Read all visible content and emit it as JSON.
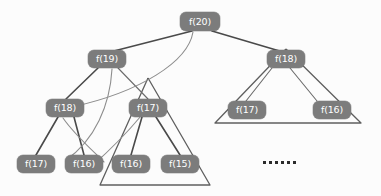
{
  "figure": {
    "background_color": "#fcfcfc",
    "node_fill_color": "#7c7c7c",
    "node_text_color": "#ffffff",
    "edge_color": "#4a4a4a",
    "triangle_color": "#5f5f5f",
    "ellipsis_color": "#2b2b2b"
  },
  "nodes": {
    "root": {
      "label": "f(20)",
      "x": 180,
      "y": 12
    },
    "left_child": {
      "label": "f(19)",
      "x": 88,
      "y": 50
    },
    "left_left": {
      "label": "f(18)",
      "x": 46,
      "y": 99
    },
    "left_left_left": {
      "label": "f(17)",
      "x": 17,
      "y": 155
    },
    "left_left_right": {
      "label": "f(16)",
      "x": 65,
      "y": 155
    },
    "left_right": {
      "label": "f(17)",
      "x": 129,
      "y": 99
    },
    "left_right_left": {
      "label": "f(16)",
      "x": 112,
      "y": 155
    },
    "left_right_right": {
      "label": "f(15)",
      "x": 161,
      "y": 155
    },
    "right_child": {
      "label": "f(18)",
      "x": 267,
      "y": 50
    },
    "right_left": {
      "label": "f(17)",
      "x": 228,
      "y": 101
    },
    "right_right": {
      "label": "f(16)",
      "x": 313,
      "y": 101
    }
  },
  "ellipsis": {
    "label": "......",
    "dot_count": 6,
    "x": 263,
    "y": 161
  }
}
